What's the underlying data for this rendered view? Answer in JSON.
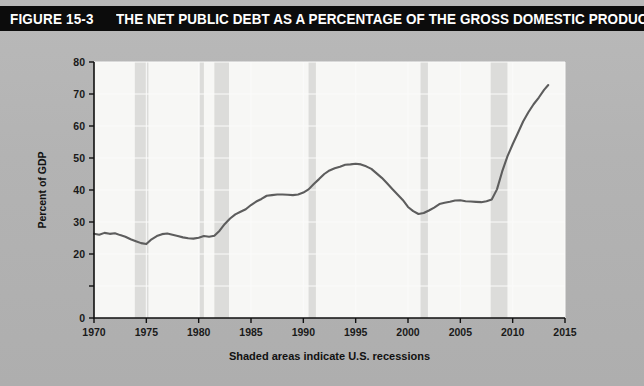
{
  "figure": {
    "number": "FIGURE 15-3",
    "title": "THE NET PUBLIC DEBT AS A PERCENTAGE OF THE GROSS DOMESTIC PRODUCT (GDP)"
  },
  "chart_data": {
    "type": "line",
    "title": "THE NET PUBLIC DEBT AS A PERCENTAGE OF THE GROSS DOMESTIC PRODUCT (GDP)",
    "xlabel": "",
    "ylabel": "Percent of GDP",
    "caption": "Shaded areas indicate U.S. recessions",
    "xlim": [
      1970,
      2015
    ],
    "ylim": [
      0,
      80
    ],
    "xticks": [
      1970,
      1975,
      1980,
      1985,
      1990,
      1995,
      2000,
      2005,
      2010,
      2015
    ],
    "xtick_labels": [
      "1970",
      "1975",
      "1980",
      "1985",
      "1990",
      "1995",
      "2000",
      "2005",
      "2010",
      "2015"
    ],
    "yticks": [
      0,
      10,
      20,
      30,
      40,
      50,
      60,
      70,
      80
    ],
    "ytick_labels": [
      "0",
      "",
      "20",
      "30",
      "40",
      "50",
      "60",
      "70",
      "80"
    ],
    "grid": true,
    "legend": null,
    "series": [
      {
        "name": "Net public debt as a percentage of GDP",
        "color": "#5d5d5d",
        "x": [
          1970.0,
          1970.5,
          1971.0,
          1971.5,
          1972.0,
          1972.5,
          1973.0,
          1973.5,
          1974.0,
          1974.5,
          1975.0,
          1975.5,
          1976.0,
          1976.5,
          1977.0,
          1977.5,
          1978.0,
          1978.5,
          1979.0,
          1979.5,
          1980.0,
          1980.5,
          1981.0,
          1981.5,
          1982.0,
          1982.5,
          1983.0,
          1983.5,
          1984.0,
          1984.5,
          1985.0,
          1985.5,
          1986.0,
          1986.5,
          1987.0,
          1987.5,
          1988.0,
          1988.5,
          1989.0,
          1989.5,
          1990.0,
          1990.5,
          1991.0,
          1991.5,
          1992.0,
          1992.5,
          1993.0,
          1993.5,
          1994.0,
          1994.5,
          1995.0,
          1995.5,
          1996.0,
          1996.5,
          1997.0,
          1997.5,
          1998.0,
          1998.5,
          1999.0,
          1999.5,
          2000.0,
          2000.5,
          2001.0,
          2001.5,
          2002.0,
          2002.5,
          2003.0,
          2003.5,
          2004.0,
          2004.5,
          2005.0,
          2005.5,
          2006.0,
          2006.5,
          2007.0,
          2007.5,
          2008.0,
          2008.5,
          2009.0,
          2009.5,
          2010.0,
          2010.5,
          2011.0,
          2011.5,
          2012.0,
          2012.5,
          2013.0,
          2013.4
        ],
        "values": [
          26.3,
          26.0,
          26.6,
          26.3,
          26.5,
          25.9,
          25.4,
          24.6,
          24.0,
          23.4,
          23.1,
          24.6,
          25.6,
          26.2,
          26.4,
          26.0,
          25.6,
          25.2,
          24.9,
          24.8,
          25.1,
          25.6,
          25.4,
          25.7,
          27.3,
          29.4,
          31.1,
          32.4,
          33.2,
          34.0,
          35.3,
          36.4,
          37.2,
          38.2,
          38.4,
          38.6,
          38.6,
          38.5,
          38.4,
          38.6,
          39.2,
          40.2,
          41.9,
          43.4,
          45.0,
          46.1,
          46.8,
          47.3,
          47.9,
          48.0,
          48.2,
          48.0,
          47.4,
          46.6,
          45.2,
          43.8,
          42.1,
          40.3,
          38.6,
          36.9,
          34.7,
          33.4,
          32.5,
          32.8,
          33.6,
          34.5,
          35.6,
          36.0,
          36.3,
          36.7,
          36.8,
          36.5,
          36.4,
          36.3,
          36.2,
          36.5,
          37.0,
          40.2,
          45.8,
          50.5,
          54.3,
          57.8,
          61.4,
          64.3,
          66.8,
          68.9,
          71.3,
          72.8
        ]
      }
    ],
    "recessions": [
      {
        "start": 1973.9,
        "end": 1975.2
      },
      {
        "start": 1980.1,
        "end": 1980.5
      },
      {
        "start": 1981.5,
        "end": 1982.9
      },
      {
        "start": 1990.5,
        "end": 1991.2
      },
      {
        "start": 2001.2,
        "end": 2001.9
      },
      {
        "start": 2007.9,
        "end": 2009.5
      }
    ]
  }
}
